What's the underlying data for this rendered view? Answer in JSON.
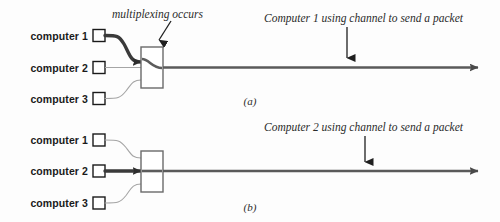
{
  "figure": {
    "type": "network-multiplexing-diagram",
    "colors": {
      "background": "#fdfdfd",
      "label_text": "#1a1a1a",
      "annotation_text": "#2b2b2b",
      "channel_line": "#555555",
      "idle_link": "#9a9a9a",
      "active_link": "#333333",
      "node_box_stroke": "#1a1a1a",
      "mux_box_stroke": "#666666"
    }
  },
  "panels": [
    {
      "id": "panel-a",
      "caption": "(a)",
      "mux_annotation": "multiplexing occurs",
      "channel_annotation": "Computer 1 using channel to send a packet",
      "active_computer": "computer 1",
      "nodes": [
        {
          "label": "computer 1",
          "active": true
        },
        {
          "label": "computer 2",
          "active": false
        },
        {
          "label": "computer 3",
          "active": false
        }
      ]
    },
    {
      "id": "panel-b",
      "caption": "(b)",
      "mux_annotation": "",
      "channel_annotation": "Computer 2 using channel to send a packet",
      "active_computer": "computer 2",
      "nodes": [
        {
          "label": "computer 1",
          "active": false
        },
        {
          "label": "computer 2",
          "active": true
        },
        {
          "label": "computer 3",
          "active": false
        }
      ]
    }
  ]
}
